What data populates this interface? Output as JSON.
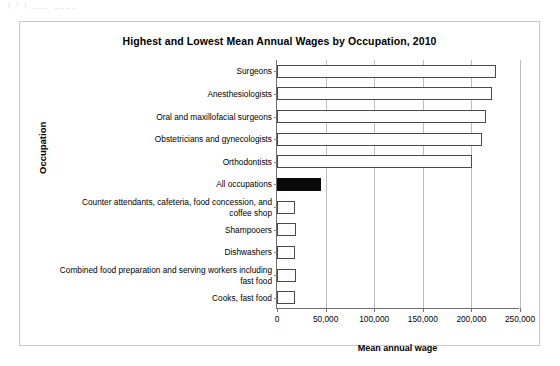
{
  "page": {
    "faint_header": "(  /  )  ___   ____"
  },
  "chart_data": {
    "type": "bar",
    "orientation": "horizontal",
    "title": "Highest and Lowest Mean Annual Wages by Occupation, 2010",
    "xlabel": "Mean annual wage",
    "ylabel": "Occupation",
    "xlim": [
      0,
      250000
    ],
    "xticks": [
      0,
      50000,
      100000,
      150000,
      200000,
      250000
    ],
    "xtick_labels": [
      "0",
      "50,000",
      "100,000",
      "150,000",
      "200,000",
      "250,000"
    ],
    "grid": true,
    "legend": "none",
    "categories": [
      "Surgeons",
      "Anesthesiologists",
      "Oral and maxillofacial surgeons",
      "Obstetricians and gynecologists",
      "Orthodontists",
      "All occupations",
      "Counter attendants, cafeteria, food concession, and\ncoffee shop",
      "Shampooers",
      "Dishwashers",
      "Combined food preparation and serving workers including\nfast food",
      "Cooks, fast food"
    ],
    "values": [
      225000,
      221000,
      215000,
      211000,
      201000,
      45000,
      19000,
      19500,
      19000,
      20000,
      19000
    ],
    "highlight_index": 5,
    "colors": {
      "bar_fill": "#fdfdfd",
      "bar_border": "#4a4a4a",
      "highlight_fill": "#090909",
      "gridline": "#bdbdbd",
      "axis": "#6e6e6e"
    }
  }
}
